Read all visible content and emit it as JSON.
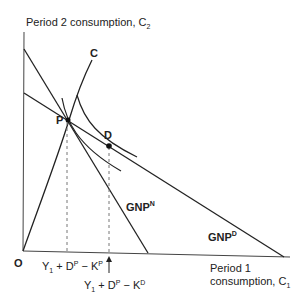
{
  "diagram": {
    "y_axis_label": {
      "text": "Period 2 consumption, C",
      "subscript": "2"
    },
    "x_axis_label": {
      "line1": "Period 1",
      "line2": "consumption, C",
      "subscript": "1"
    },
    "origin_label": "O",
    "curve_label_c": "C",
    "point_p_label": "P",
    "point_d_label": "D",
    "budget_line_n": {
      "base": "GNP",
      "superscript": "N"
    },
    "budget_line_d": {
      "base": "GNP",
      "superscript": "D"
    },
    "x_marker_p": {
      "y": "Y",
      "ysub": "1",
      "plus": " + D",
      "dsup": "P",
      "minus": " − K",
      "ksup": "P"
    },
    "x_marker_d": {
      "y": "Y",
      "ysub": "1",
      "plus": " + D",
      "dsup": "P",
      "minus": " − K",
      "ksup": "D"
    },
    "colors": {
      "line": "#222222",
      "guide": "#777777"
    }
  }
}
